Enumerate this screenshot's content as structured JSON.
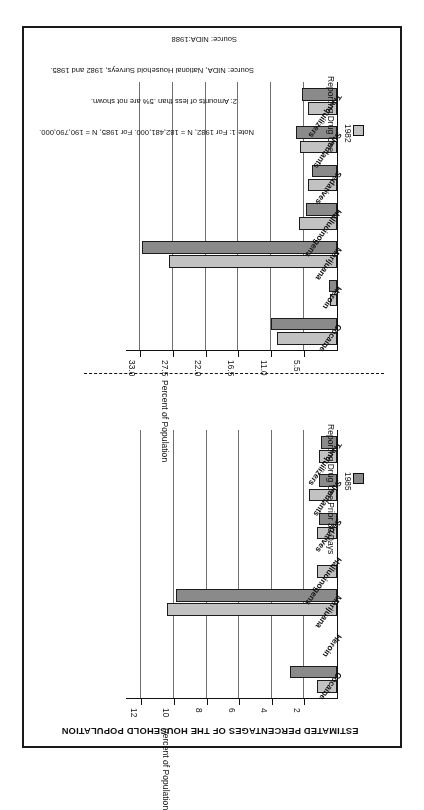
{
  "document": {
    "title": "ESTIMATED PERCENTAGES OF THE HOUSEHOLD POPULATION"
  },
  "notes": {
    "line1": "Note 1: For 1982, N = 182,481,000. For 1985, N = 190,790,000.",
    "line2": "2: Amounts of less than .5% are not shown.",
    "line3": "Source: NIDA, National Household Surveys, 1982 and 1985.",
    "line4": "Source: NIDA:1988"
  },
  "legend": {
    "series_1982": "1982",
    "series_1985": "1985",
    "color_1982": "#c2c2c2",
    "color_1985": "#8a8a8a"
  },
  "chart_data": [
    {
      "id": "prior-30-days",
      "type": "bar",
      "orientation": "horizontal",
      "title": "Reporting Drug Use Prior 30 Days",
      "xlabel": "",
      "ylabel": "Percent of Population",
      "axis_title": "Percent of Population",
      "categories": [
        "Cocaine",
        "Heroin",
        "Marijuana",
        "Hallucinogens",
        "Sedatives",
        "Stimulants",
        "Tranquilizers"
      ],
      "ticks": [
        "2",
        "4",
        "6",
        "8",
        "10",
        "12"
      ],
      "tick_values": [
        2,
        4,
        6,
        8,
        10,
        12
      ],
      "xlim": [
        0,
        13
      ],
      "grid": true,
      "legend_position": "top-left",
      "series": [
        {
          "name": "1982",
          "color": "#c2c2c2",
          "values": [
            1.2,
            0.0,
            10.4,
            1.2,
            1.2,
            1.7,
            1.1
          ]
        },
        {
          "name": "1985",
          "color": "#8a8a8a",
          "values": [
            2.9,
            0.0,
            9.9,
            0.0,
            1.1,
            1.1,
            1.0
          ]
        }
      ]
    },
    {
      "id": "lifetime",
      "type": "bar",
      "orientation": "horizontal",
      "title": "Reporting Drug Use",
      "xlabel": "",
      "ylabel": "Percent of Population",
      "axis_title": "Percent of Population",
      "categories": [
        "Cocaine",
        "Heroin",
        "Marijuana",
        "Hallucinogens",
        "Sedatives",
        "Stimulants",
        "Tranquilizers"
      ],
      "ticks": [
        "5.5",
        "11.0",
        "16.5",
        "22.0",
        "27.5",
        "33.0"
      ],
      "tick_values": [
        5.5,
        11.0,
        16.5,
        22.0,
        27.5,
        33.0
      ],
      "xlim": [
        0,
        35.5
      ],
      "grid": true,
      "legend_position": "top-left",
      "series": [
        {
          "name": "1982",
          "color": "#c2c2c2",
          "values": [
            10.0,
            1.2,
            28.1,
            6.4,
            4.9,
            6.2,
            4.8
          ]
        },
        {
          "name": "1985",
          "color": "#8a8a8a",
          "values": [
            11.0,
            1.4,
            32.6,
            5.2,
            4.2,
            6.8,
            5.8
          ]
        }
      ]
    }
  ]
}
